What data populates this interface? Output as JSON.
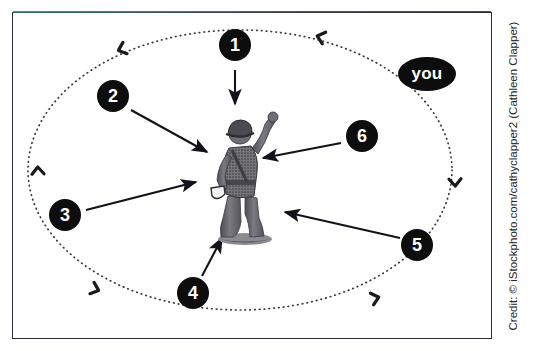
{
  "figure": {
    "frame": {
      "border_color": "#2b2b33",
      "background": "#ffffff"
    },
    "orbit": {
      "name": "dotted-orbit-ellipse",
      "style": "dotted",
      "direction": "counter-clockwise",
      "dot_color": "#3a3a3a",
      "marker_count": 6,
      "marker_label": "direction-chevron"
    },
    "viewer_label": {
      "text": "you",
      "background": "#0d0d0d",
      "text_color": "#ffffff"
    },
    "subject": {
      "name": "toy-soldier-figurine",
      "description": "grayscale photo of a plastic toy soldier with helmet and raised arm",
      "tone": "#6f6f73"
    },
    "callouts": [
      {
        "number": "1",
        "bubble_x": 235,
        "bubble_y": 45,
        "r": 16,
        "arrow": {
          "x1": 235,
          "y1": 70,
          "x2": 235,
          "y2": 104
        }
      },
      {
        "number": "2",
        "bubble_x": 113,
        "bubble_y": 96,
        "r": 16,
        "arrow": {
          "x1": 131,
          "y1": 110,
          "x2": 207,
          "y2": 152
        }
      },
      {
        "number": "3",
        "bubble_x": 65,
        "bubble_y": 215,
        "r": 16,
        "arrow": {
          "x1": 86,
          "y1": 210,
          "x2": 196,
          "y2": 182
        }
      },
      {
        "number": "4",
        "bubble_x": 193,
        "bubble_y": 293,
        "r": 16,
        "arrow": {
          "x1": 202,
          "y1": 276,
          "x2": 222,
          "y2": 238
        }
      },
      {
        "number": "5",
        "bubble_x": 417,
        "bubble_y": 245,
        "r": 16,
        "arrow": {
          "x1": 400,
          "y1": 238,
          "x2": 285,
          "y2": 212
        }
      },
      {
        "number": "6",
        "bubble_x": 362,
        "bubble_y": 136,
        "r": 16,
        "arrow": {
          "x1": 341,
          "y1": 143,
          "x2": 263,
          "y2": 158
        }
      }
    ],
    "credit": "Credit: © iStockphoto.com/cathyclapper2 (Cathleen Clapper)"
  }
}
